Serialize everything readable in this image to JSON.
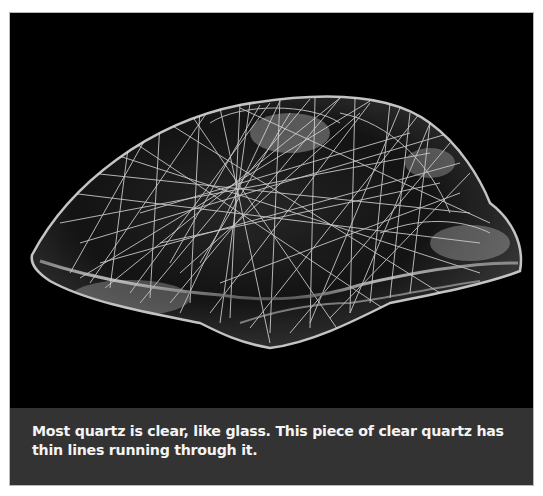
{
  "figure": {
    "image": {
      "subject": "clear quartz crystal with thin needle-like inclusions",
      "background_color": "#000000",
      "icon": "quartz-crystal-photo"
    },
    "caption": {
      "text": "Most quartz is clear, like glass.  This piece of clear quartz has thin lines running through it.",
      "background_color": "#333333",
      "text_color": "#f4f4f4"
    }
  }
}
